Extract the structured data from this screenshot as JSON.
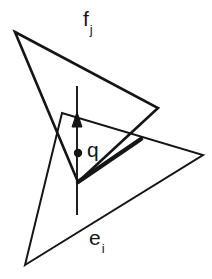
{
  "figure": {
    "background_color": "#ffffff",
    "stroke_color": "#151515",
    "width": 212,
    "height": 279,
    "labels": {
      "face": {
        "base": "f",
        "subscript": "j",
        "full": "f_j",
        "x": 83,
        "y": 8
      },
      "point": {
        "base": "q",
        "subscript": "",
        "full": "q",
        "x": 87,
        "y": 139
      },
      "edge": {
        "base": "e",
        "subscript": "i",
        "full": "e_i",
        "x": 89,
        "y": 227
      }
    },
    "marker": {
      "name": "q",
      "cx": 78,
      "cy": 153,
      "r": 4.2
    },
    "shapes": {
      "triangle_fj": {
        "name": "triangle-fj",
        "points": "15,32 158,108 78,182",
        "stroke_width": 2.6
      },
      "triangle_ei": {
        "name": "triangle-ei",
        "points": "25,265 203,155 62,113",
        "stroke_width": 2.0
      },
      "thick_edge_ei": {
        "name": "thick-edge-ei",
        "x1": 78,
        "y1": 182,
        "x2": 141,
        "y2": 139,
        "stroke_width": 4.4
      },
      "normal_arrow": {
        "name": "normal-arrow",
        "x1": 77,
        "y1": 215,
        "x2": 77,
        "y2": 86,
        "stroke_width": 1.9,
        "arrow_head": "77,112 72,127 82,127"
      }
    }
  }
}
